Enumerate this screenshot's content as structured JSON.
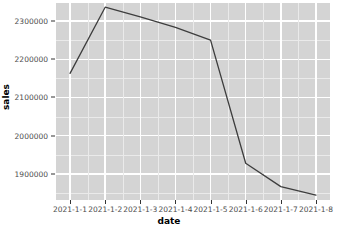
{
  "chart_data": {
    "type": "line",
    "title": "",
    "xlabel": "date",
    "ylabel": "sales",
    "categories": [
      "2021-1-1",
      "2021-1-2",
      "2021-1-3",
      "2021-1-4",
      "2021-1-5",
      "2021-1-6",
      "2021-1-7",
      "2021-1-8"
    ],
    "values": [
      2163000,
      2336000,
      2311000,
      2283000,
      2250000,
      1928000,
      1867000,
      1845000
    ],
    "series": [
      {
        "name": "sales",
        "values": [
          2163000,
          2336000,
          2311000,
          2283000,
          2250000,
          1928000,
          1867000,
          1845000
        ]
      }
    ],
    "y_ticks": [
      1900000,
      2000000,
      2100000,
      2200000,
      2300000
    ],
    "y_tick_labels": [
      "1900000",
      "2000000",
      "2100000",
      "2200000",
      "2300000"
    ],
    "x_tick_labels": [
      "2021-1-1",
      "2021-1-2",
      "2021-1-3",
      "2021-1-4",
      "2021-1-5",
      "2021-1-6",
      "2021-1-7",
      "2021-1-8"
    ],
    "ylim": [
      1832000,
      2347000
    ],
    "xlim": [
      0.6,
      8.4
    ],
    "grid": true,
    "legend": "none",
    "line_color": "#3d3d3d",
    "panel_color": "#d4d4d4",
    "gridline_color": "#ffffff",
    "background_color": "#ffffff"
  },
  "axes": {
    "x_title": "date",
    "y_title": "sales"
  }
}
